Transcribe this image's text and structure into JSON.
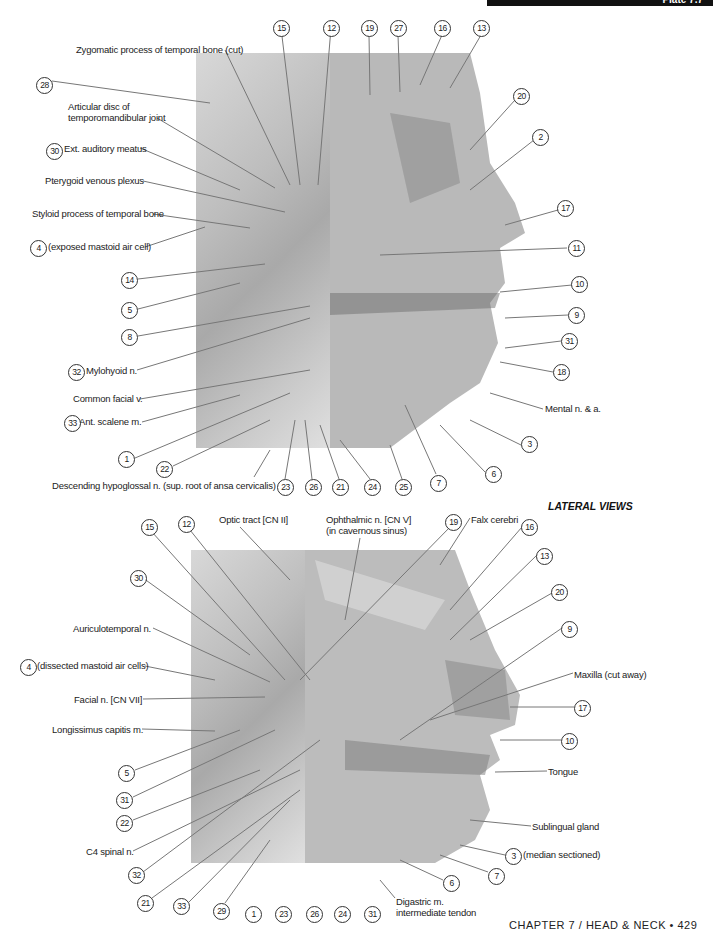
{
  "header": {
    "plate": "Plate 7.7"
  },
  "section_title": "LATERAL VIEWS",
  "footer": "CHAPTER 7 / HEAD & NECK • 429",
  "top_figure": {
    "text_labels": [
      {
        "id": "t_zyg",
        "text": "Zygomatic process of temporal bone (cut)",
        "x": 76,
        "y": 44
      },
      {
        "id": "t_disc1",
        "text": "Articular disc of",
        "x": 68,
        "y": 101
      },
      {
        "id": "t_disc2",
        "text": "temporomandibular joint",
        "x": 68,
        "y": 112
      },
      {
        "id": "t_eam",
        "text": "Ext. auditory meatus",
        "x": 64,
        "y": 143
      },
      {
        "id": "t_ptery",
        "text": "Pterygoid venous plexus",
        "x": 45,
        "y": 175
      },
      {
        "id": "t_styl",
        "text": "Styloid process of temporal bone",
        "x": 32,
        "y": 208
      },
      {
        "id": "t_mast",
        "text": "(exposed mastoid air cell)",
        "x": 48,
        "y": 241
      },
      {
        "id": "t_mylo",
        "text": "Mylohyoid n.",
        "x": 86,
        "y": 365
      },
      {
        "id": "t_cfv",
        "text": "Common facial v.",
        "x": 73,
        "y": 393
      },
      {
        "id": "t_scal",
        "text": "Ant. scalene m.",
        "x": 79,
        "y": 416
      },
      {
        "id": "t_desc",
        "text": "Descending hypoglossal n. (sup. root of ansa cervicalis)",
        "x": 52,
        "y": 480
      },
      {
        "id": "t_mental",
        "text": "Mental n. & a.",
        "x": 545,
        "y": 403
      }
    ],
    "numbers": [
      {
        "n": "28",
        "x": 36,
        "y": 77
      },
      {
        "n": "30",
        "x": 46,
        "y": 143
      },
      {
        "n": "4",
        "x": 30,
        "y": 240
      },
      {
        "n": "14",
        "x": 121,
        "y": 272
      },
      {
        "n": "5",
        "x": 121,
        "y": 302
      },
      {
        "n": "8",
        "x": 121,
        "y": 329
      },
      {
        "n": "32",
        "x": 68,
        "y": 364
      },
      {
        "n": "33",
        "x": 64,
        "y": 415
      },
      {
        "n": "1",
        "x": 118,
        "y": 451
      },
      {
        "n": "22",
        "x": 156,
        "y": 461
      },
      {
        "n": "15",
        "x": 273,
        "y": 20
      },
      {
        "n": "12",
        "x": 323,
        "y": 20
      },
      {
        "n": "19",
        "x": 361,
        "y": 20
      },
      {
        "n": "27",
        "x": 390,
        "y": 20
      },
      {
        "n": "16",
        "x": 434,
        "y": 20
      },
      {
        "n": "13",
        "x": 473,
        "y": 20
      },
      {
        "n": "20",
        "x": 513,
        "y": 88
      },
      {
        "n": "2",
        "x": 532,
        "y": 129
      },
      {
        "n": "17",
        "x": 557,
        "y": 200
      },
      {
        "n": "11",
        "x": 568,
        "y": 240
      },
      {
        "n": "10",
        "x": 571,
        "y": 276
      },
      {
        "n": "9",
        "x": 568,
        "y": 307
      },
      {
        "n": "31",
        "x": 561,
        "y": 333
      },
      {
        "n": "18",
        "x": 553,
        "y": 364
      },
      {
        "n": "3",
        "x": 521,
        "y": 436
      },
      {
        "n": "6",
        "x": 485,
        "y": 466
      },
      {
        "n": "7",
        "x": 430,
        "y": 475
      },
      {
        "n": "23",
        "x": 277,
        "y": 479
      },
      {
        "n": "26",
        "x": 305,
        "y": 479
      },
      {
        "n": "21",
        "x": 332,
        "y": 479
      },
      {
        "n": "24",
        "x": 364,
        "y": 479
      },
      {
        "n": "25",
        "x": 395,
        "y": 479
      }
    ]
  },
  "bottom_figure": {
    "text_labels": [
      {
        "id": "b_optic",
        "text": "Optic tract [CN II]",
        "x": 219,
        "y": 514
      },
      {
        "id": "b_oph1",
        "text": "Ophthalmic n. [CN V]",
        "x": 326,
        "y": 514
      },
      {
        "id": "b_oph2",
        "text": "(in cavernous sinus)",
        "x": 326,
        "y": 525
      },
      {
        "id": "b_falx",
        "text": "Falx cerebri",
        "x": 471,
        "y": 514
      },
      {
        "id": "b_auric",
        "text": "Auriculotemporal n.",
        "x": 73,
        "y": 623
      },
      {
        "id": "b_mast",
        "text": "(dissected mastoid air cells)",
        "x": 37,
        "y": 660
      },
      {
        "id": "b_facial",
        "text": "Facial n. [CN VII]",
        "x": 74,
        "y": 694
      },
      {
        "id": "b_long",
        "text": "Longissimus capitis m.",
        "x": 52,
        "y": 724
      },
      {
        "id": "b_c4",
        "text": "C4 spinal n.",
        "x": 86,
        "y": 846
      },
      {
        "id": "b_maxilla",
        "text": "Maxilla (cut away)",
        "x": 574,
        "y": 669
      },
      {
        "id": "b_tongue",
        "text": "Tongue",
        "x": 548,
        "y": 766
      },
      {
        "id": "b_subl",
        "text": "Sublingual gland",
        "x": 532,
        "y": 821
      },
      {
        "id": "b_median",
        "text": "(median sectioned)",
        "x": 523,
        "y": 849
      },
      {
        "id": "b_dig1",
        "text": "Digastric m.",
        "x": 396,
        "y": 896
      },
      {
        "id": "b_dig2",
        "text": "intermediate tendon",
        "x": 396,
        "y": 907
      }
    ],
    "numbers": [
      {
        "n": "15",
        "x": 141,
        "y": 519
      },
      {
        "n": "12",
        "x": 178,
        "y": 516
      },
      {
        "n": "30",
        "x": 130,
        "y": 570
      },
      {
        "n": "4",
        "x": 20,
        "y": 659
      },
      {
        "n": "5",
        "x": 118,
        "y": 765
      },
      {
        "n": "31",
        "x": 116,
        "y": 792
      },
      {
        "n": "22",
        "x": 116,
        "y": 815
      },
      {
        "n": "32",
        "x": 128,
        "y": 867
      },
      {
        "n": "21",
        "x": 137,
        "y": 895
      },
      {
        "n": "33",
        "x": 173,
        "y": 898
      },
      {
        "n": "29",
        "x": 213,
        "y": 903
      },
      {
        "n": "1",
        "x": 245,
        "y": 906
      },
      {
        "n": "23",
        "x": 275,
        "y": 906
      },
      {
        "n": "26",
        "x": 306,
        "y": 906
      },
      {
        "n": "24",
        "x": 334,
        "y": 906
      },
      {
        "n": "31b",
        "label": "31",
        "x": 364,
        "y": 906
      },
      {
        "n": "19",
        "x": 445,
        "y": 514
      },
      {
        "n": "16",
        "x": 521,
        "y": 519
      },
      {
        "n": "13",
        "x": 536,
        "y": 548
      },
      {
        "n": "20",
        "x": 551,
        "y": 584
      },
      {
        "n": "9",
        "x": 561,
        "y": 621
      },
      {
        "n": "17",
        "x": 574,
        "y": 700
      },
      {
        "n": "10",
        "x": 561,
        "y": 733
      },
      {
        "n": "3",
        "x": 505,
        "y": 848
      },
      {
        "n": "7",
        "x": 488,
        "y": 868
      },
      {
        "n": "6",
        "x": 443,
        "y": 875
      }
    ]
  }
}
